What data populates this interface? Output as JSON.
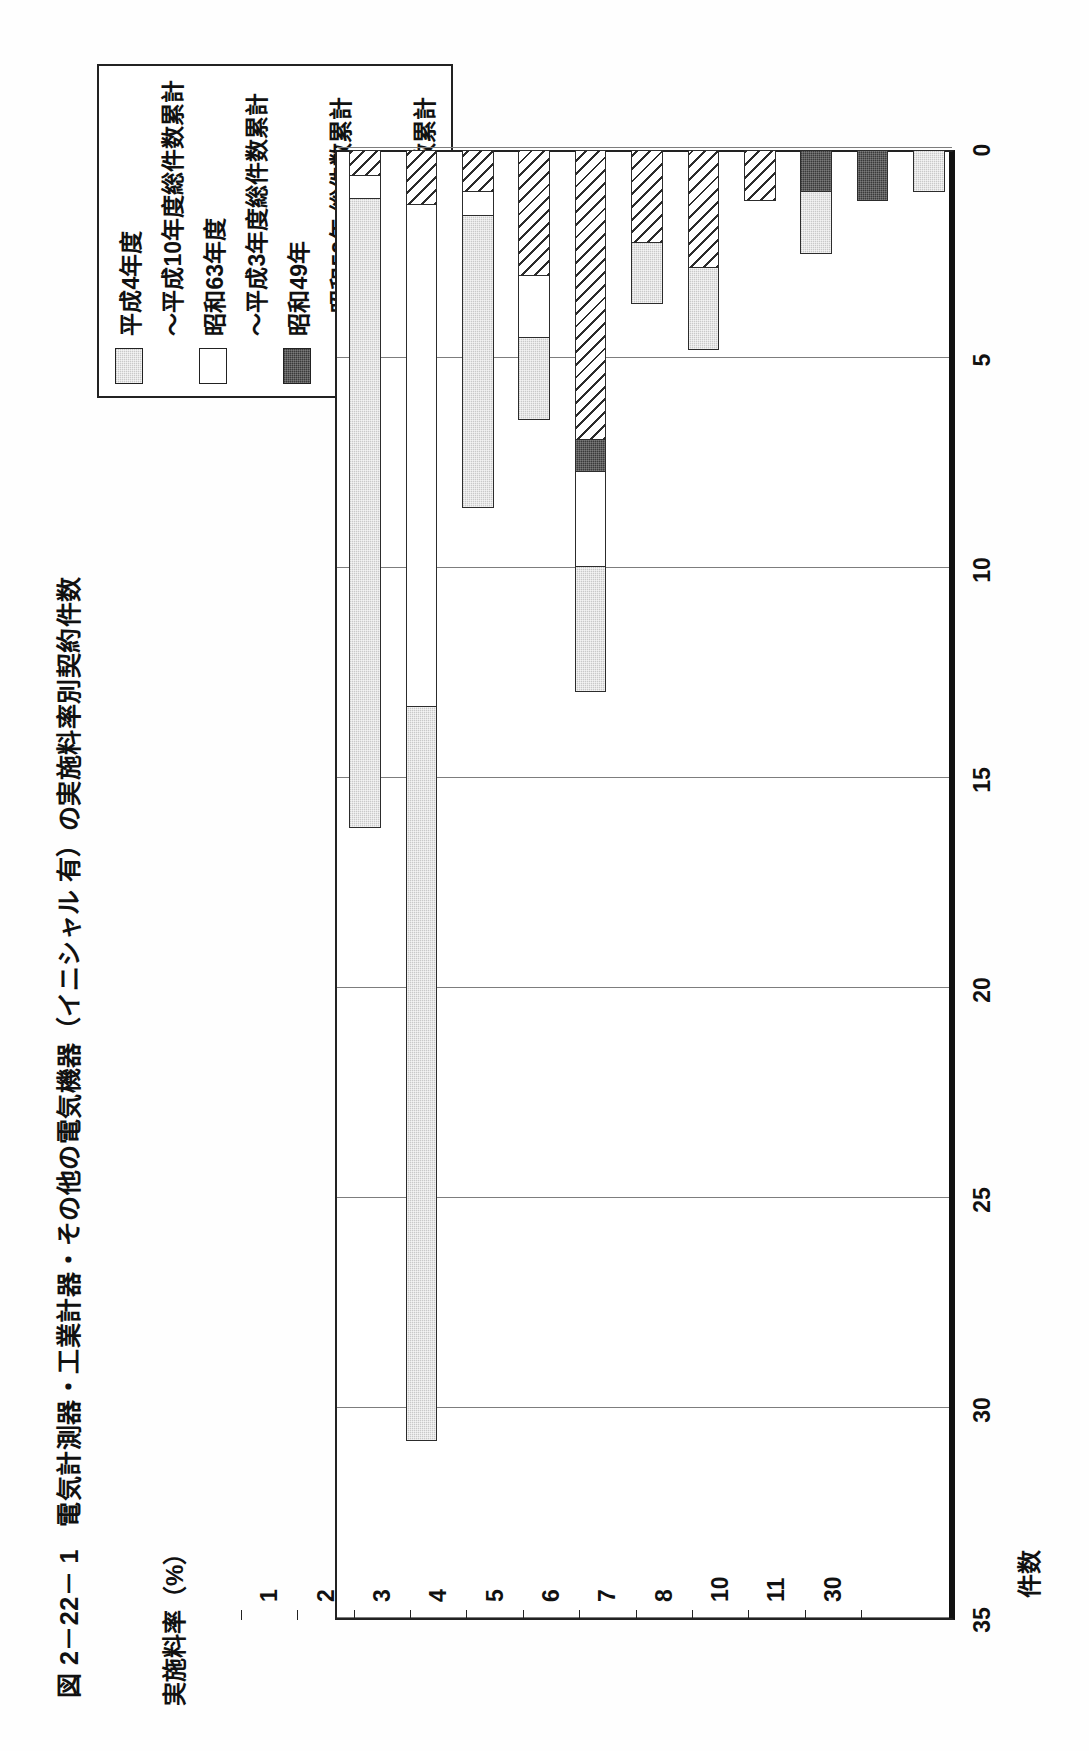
{
  "figure": {
    "number": "図 2－22－ 1",
    "title": "電気計測器・工業計器・その他の電気機器（イニシャル 有）の実施料率別契約件数"
  },
  "legend": {
    "items": [
      {
        "pattern": "light-gray-dotted",
        "label": "平成4年度",
        "label2": "～平成10年度総件数累計"
      },
      {
        "pattern": "white",
        "label": "昭和63年度",
        "label2": "～平成3年度総件数累計"
      },
      {
        "pattern": "dark-solid",
        "label": "昭和49年",
        "label2": "～昭和52年 総件数累計"
      },
      {
        "pattern": "diagonal-hatch",
        "label": "昭和43年",
        "label2": "～昭和48年 総件数累計"
      }
    ]
  },
  "chart_data": {
    "type": "bar",
    "orientation": "horizontal-stacked",
    "title": "電気計測器・工業計器・その他の電気機器（イニシャル 有）の実施料率別契約件数",
    "xlabel": "実施料率（%）",
    "ylabel": "件数",
    "ylim": [
      0,
      35
    ],
    "yticks": [
      "0",
      "5",
      "10",
      "15",
      "20",
      "25",
      "30",
      "35"
    ],
    "grid": true,
    "legend_position": "top-right",
    "categories": [
      "1",
      "2",
      "3",
      "4",
      "5",
      "6",
      "7",
      "8",
      "10",
      "11",
      "30"
    ],
    "series": [
      {
        "name": "平成4年度～平成10年度総件数累計",
        "pattern": "light-gray-dotted",
        "values": [
          15.0,
          17.5,
          7.0,
          2.0,
          3.0,
          1.5,
          2.0,
          0.0,
          1.5,
          0.0,
          1.0
        ]
      },
      {
        "name": "昭和63年度～平成3年度総件数累計",
        "pattern": "white",
        "values": [
          0.6,
          12.0,
          0.6,
          1.5,
          2.3,
          0.0,
          0.0,
          0.0,
          0.0,
          0.0,
          0.0
        ]
      },
      {
        "name": "昭和49年～昭和52年 総件数累計",
        "pattern": "dark-solid",
        "values": [
          0.0,
          0.0,
          0.0,
          0.0,
          0.8,
          0.0,
          0.0,
          0.0,
          1.0,
          1.2,
          0.0
        ]
      },
      {
        "name": "昭和43年～昭和48年 総件数累計",
        "pattern": "diagonal-hatch",
        "values": [
          0.6,
          1.3,
          1.0,
          3.0,
          6.9,
          2.2,
          2.8,
          1.2,
          0.0,
          0.0,
          0.0
        ]
      }
    ],
    "totals": [
      16.2,
      30.8,
      8.6,
      6.5,
      13.0,
      3.7,
      4.8,
      1.2,
      2.5,
      1.2,
      1.0
    ]
  }
}
